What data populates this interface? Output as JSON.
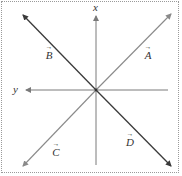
{
  "diagram": {
    "type": "vector-coordinate-diagram",
    "axes": {
      "vertical": {
        "label": "x",
        "direction": "up"
      },
      "horizontal": {
        "label": "y",
        "direction": "left"
      }
    },
    "vectors": [
      {
        "id": "A",
        "label": "A",
        "arrow": "→",
        "quadrant": "upper-right",
        "color": "#8a8a8a"
      },
      {
        "id": "B",
        "label": "B",
        "arrow": "→",
        "quadrant": "upper-left",
        "color": "#3a3a3a"
      },
      {
        "id": "C",
        "label": "C",
        "arrow": "→",
        "quadrant": "lower-left",
        "color": "#8a8a8a"
      },
      {
        "id": "D",
        "label": "D",
        "arrow": "→",
        "quadrant": "lower-right",
        "color": "#3a3a3a"
      }
    ],
    "colors": {
      "axis": "#7a7a7a",
      "dark_line": "#3a3a3a",
      "light_line": "#8a8a8a",
      "border": "#9a9a9a",
      "text": "#333333"
    }
  }
}
